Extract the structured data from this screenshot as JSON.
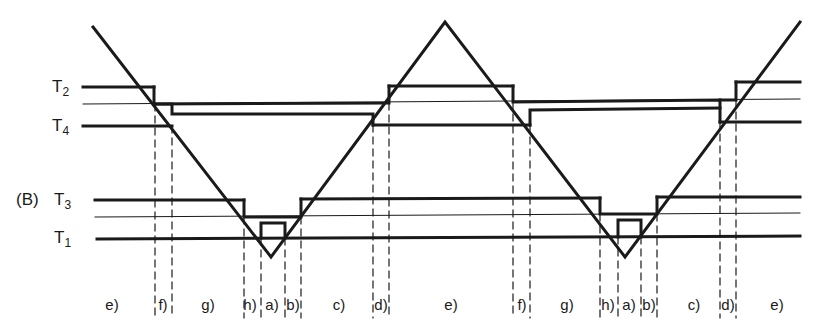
{
  "figure": {
    "panel_label": "(B)",
    "levels": [
      {
        "name": "T",
        "sub": "2",
        "y": 87
      },
      {
        "name": "T",
        "sub": "4",
        "y": 126
      },
      {
        "name": "T",
        "sub": "3",
        "y": 200
      },
      {
        "name": "T",
        "sub": "1",
        "y": 237
      }
    ],
    "thin_lines_y": [
      104,
      217
    ],
    "segment_labels": [
      {
        "text": "e)",
        "x": 112
      },
      {
        "text": "f)",
        "x": 163
      },
      {
        "text": "g)",
        "x": 208
      },
      {
        "text": "h)",
        "x": 249
      },
      {
        "text": "a)",
        "x": 270
      },
      {
        "text": "b)",
        "x": 292
      },
      {
        "text": "c)",
        "x": 340
      },
      {
        "text": "d)",
        "x": 382
      },
      {
        "text": "e)",
        "x": 450
      },
      {
        "text": "f)",
        "x": 522
      },
      {
        "text": "g)",
        "x": 567
      },
      {
        "text": "h)",
        "x": 607
      },
      {
        "text": "a)",
        "x": 628
      },
      {
        "text": "b)",
        "x": 648
      },
      {
        "text": "c)",
        "x": 693
      },
      {
        "text": "d)",
        "x": 728
      },
      {
        "text": "e)",
        "x": 778
      }
    ],
    "colors": {
      "ink": "#1a1a1a",
      "background": "#ffffff"
    }
  }
}
